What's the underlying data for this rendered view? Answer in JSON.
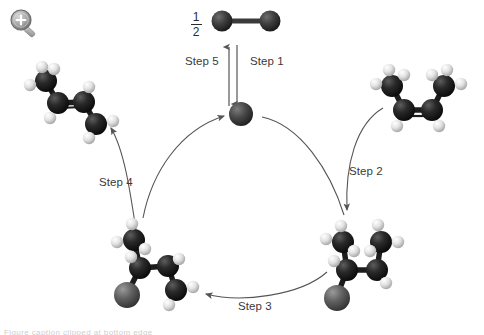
{
  "page": {
    "background_color": "#ffffff",
    "width": 484,
    "height": 335
  },
  "toolbar": {
    "zoom_icon_name": "zoom-in-magnifier-icon",
    "zoom_icon_glyph": "+"
  },
  "reagent": {
    "coefficient_numerator": "1",
    "coefficient_denominator": "2",
    "label": "½ H2 diatomic molecule"
  },
  "steps": [
    {
      "id": "step1",
      "label": "Step 1",
      "direction": "down",
      "description": "Diatomic molecule adds to catalyst"
    },
    {
      "id": "step2",
      "label": "Step 2",
      "direction": "down",
      "description": "Alkene binds to catalyst"
    },
    {
      "id": "step3",
      "label": "Step 3",
      "direction": "left",
      "description": "Rearrangement on catalyst"
    },
    {
      "id": "step4",
      "label": "Step 4",
      "direction": "up",
      "description": "Product alkene released"
    },
    {
      "id": "step5",
      "label": "Step 5",
      "direction": "up",
      "description": "Catalyst regenerated"
    }
  ],
  "molecules": [
    {
      "id": "reagent-diatomic",
      "name": "diatomic-molecule",
      "position": "top-center",
      "atoms": [
        {
          "element": "C",
          "color": "#3c3c3c",
          "r": 9,
          "x": 26,
          "y": 15
        },
        {
          "element": "C",
          "color": "#3c3c3c",
          "r": 9,
          "x": 64,
          "y": 15
        }
      ],
      "bonds": [
        {
          "from": 0,
          "to": 1
        }
      ]
    },
    {
      "id": "catalyst-center",
      "name": "catalyst-atom",
      "position": "center",
      "atoms": [
        {
          "element": "M",
          "color": "#4a4a4a",
          "r": 11,
          "x": 11,
          "y": 11
        }
      ],
      "bonds": []
    },
    {
      "id": "product-alkene",
      "name": "product-alkene-molecule",
      "position": "top-left",
      "carbon_color": "#1a1a1a",
      "hydrogen_color": "#e8e8e8",
      "atom_count": 12
    },
    {
      "id": "reactant-alkene",
      "name": "reactant-alkene-molecule",
      "position": "top-right",
      "carbon_color": "#1a1a1a",
      "hydrogen_color": "#e8e8e8",
      "atom_count": 12
    },
    {
      "id": "intermediate-right",
      "name": "metal-alkyl-intermediate-molecule",
      "position": "bottom-right",
      "carbon_color": "#1a1a1a",
      "hydrogen_color": "#e8e8e8",
      "metal_color": "#5a5a5a",
      "atom_count": 14
    },
    {
      "id": "intermediate-left",
      "name": "metal-alkyl-intermediate-molecule-2",
      "position": "bottom-left",
      "carbon_color": "#1a1a1a",
      "hydrogen_color": "#e8e8e8",
      "metal_color": "#5a5a5a",
      "atom_count": 14
    }
  ],
  "colors": {
    "arrow": "#555555",
    "text": "#3a3a3a",
    "carbon": "#1a1a1a",
    "hydrogen": "#e8e8e8",
    "metal": "#5a5a5a",
    "background": "#ffffff"
  },
  "footer": {
    "clipped_caption": "Figure caption clipped at bottom edge"
  }
}
